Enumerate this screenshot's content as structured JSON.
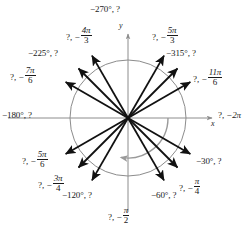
{
  "figure": {
    "title": "",
    "type": "unit-circle-negative-angles",
    "width": 252,
    "height": 227,
    "colors": {
      "ray": "#111111",
      "axis": "#8c8c8c",
      "circle": "#8c8c8c",
      "sweep_arrow": "#9a9a9a",
      "text": "#1a1a1a",
      "background": "#ffffff"
    },
    "origin": {
      "x": 128,
      "y": 118
    },
    "circle_radius": 58,
    "axes": {
      "x_label": "x",
      "y_label": "y",
      "x_extent": [
        8,
        214
      ],
      "y_extent": [
        33,
        214
      ]
    },
    "sweep_arrow": {
      "start_angle_deg": 0,
      "end_angle_deg": -100,
      "radius": 40,
      "direction": "clockwise"
    }
  },
  "chart_data": {
    "type": "scatter",
    "title": "",
    "xlabel": "x",
    "ylabel": "y",
    "rays": [
      {
        "id": "ray-neg-270",
        "angle_deg": 90,
        "label_degrees": "−270°",
        "label_radians": "?",
        "label_text": "−270°, ?",
        "known": "degrees",
        "label_pos": {
          "x": 90,
          "y": 6
        },
        "draw_ray": false
      },
      {
        "id": "ray-neg-5pi-3",
        "angle_deg": 60,
        "label_degrees": "?",
        "label_radians": "−5π/3",
        "num": "−5π",
        "den": "3",
        "label_text": "?, −5π/3",
        "known": "radians",
        "label_pos": {
          "x": 155,
          "y": 28
        },
        "draw_ray": true,
        "length": 72
      },
      {
        "id": "ray-neg-315",
        "angle_deg": 45,
        "label_degrees": "−315°",
        "label_radians": "?",
        "label_text": "−315°, ?",
        "known": "degrees",
        "label_pos": {
          "x": 168,
          "y": 50
        },
        "draw_ray": true,
        "length": 70
      },
      {
        "id": "ray-neg-11pi-6",
        "angle_deg": 30,
        "label_degrees": "?",
        "label_radians": "−11π/6",
        "num": "−11π",
        "den": "6",
        "label_text": "?, −11π/6",
        "known": "radians",
        "label_pos": {
          "x": 198,
          "y": 70
        },
        "draw_ray": true,
        "length": 72
      },
      {
        "id": "ray-neg-2pi",
        "angle_deg": 0,
        "label_degrees": "?",
        "label_radians": "−2π",
        "label_text": "?, −2π",
        "known": "radians",
        "label_pos": {
          "x": 219,
          "y": 110
        },
        "draw_ray": false
      },
      {
        "id": "ray-neg-30",
        "angle_deg": -30,
        "label_degrees": "−30°",
        "label_radians": "?",
        "label_text": "−30°, ?",
        "known": "degrees",
        "label_pos": {
          "x": 197,
          "y": 158
        },
        "draw_ray": true,
        "length": 72
      },
      {
        "id": "ray-neg-pi-4",
        "angle_deg": -45,
        "label_degrees": "?",
        "label_radians": "−π/4",
        "num": "−π",
        "den": "4",
        "label_text": "?, −π/4",
        "known": "radians",
        "label_pos": {
          "x": 180,
          "y": 178
        },
        "draw_ray": true,
        "length": 70
      },
      {
        "id": "ray-neg-60",
        "angle_deg": -60,
        "label_degrees": "−60°",
        "label_radians": "?",
        "label_text": "−60°, ?",
        "known": "degrees",
        "label_pos": {
          "x": 152,
          "y": 192
        },
        "draw_ray": true,
        "length": 72
      },
      {
        "id": "ray-neg-pi-2",
        "angle_deg": -90,
        "label_degrees": "?",
        "label_radians": "−π/2",
        "num": "−π",
        "den": "2",
        "label_text": "?, −π/2",
        "known": "radians",
        "label_pos": {
          "x": 109,
          "y": 208
        },
        "draw_ray": false
      },
      {
        "id": "ray-neg-120",
        "angle_deg": -120,
        "label_degrees": "−120°",
        "label_radians": "?",
        "label_text": "−120°, ?",
        "known": "degrees",
        "label_pos": {
          "x": 63,
          "y": 192
        },
        "draw_ray": true,
        "length": 72
      },
      {
        "id": "ray-neg-3pi-4",
        "angle_deg": -135,
        "label_degrees": "?",
        "label_radians": "−3π/4",
        "num": "−3π",
        "den": "4",
        "label_text": "?, −3π/4",
        "known": "radians",
        "label_pos": {
          "x": 38,
          "y": 176
        },
        "draw_ray": true,
        "length": 70
      },
      {
        "id": "ray-neg-5pi-6",
        "angle_deg": -150,
        "label_degrees": "?",
        "label_radians": "−5π/6",
        "num": "−5π",
        "den": "6",
        "label_text": "?, −5π/6",
        "known": "radians",
        "label_pos": {
          "x": 22,
          "y": 152
        },
        "draw_ray": true,
        "length": 72
      },
      {
        "id": "ray-neg-180",
        "angle_deg": 180,
        "label_degrees": "−180°",
        "label_radians": "?",
        "label_text": "−180°, ?",
        "known": "degrees",
        "label_pos": {
          "x": 2,
          "y": 110
        },
        "draw_ray": false
      },
      {
        "id": "ray-neg-7pi-6",
        "angle_deg": 150,
        "label_degrees": "?",
        "label_radians": "−7π/6",
        "num": "−7π",
        "den": "6",
        "label_text": "?, −7π/6",
        "known": "radians",
        "label_pos": {
          "x": 10,
          "y": 68
        },
        "draw_ray": true,
        "length": 72
      },
      {
        "id": "ray-neg-225",
        "angle_deg": 135,
        "label_degrees": "−225°",
        "label_radians": "?",
        "label_text": "−225°, ?",
        "known": "degrees",
        "label_pos": {
          "x": 28,
          "y": 50
        },
        "draw_ray": true,
        "length": 70
      },
      {
        "id": "ray-neg-4pi-3",
        "angle_deg": 120,
        "label_degrees": "?",
        "label_radians": "−4π/3",
        "num": "−4π",
        "den": "3",
        "label_text": "?, −4π/3",
        "known": "radians",
        "label_pos": {
          "x": 70,
          "y": 28
        },
        "draw_ray": true,
        "length": 72
      }
    ]
  },
  "labels": {
    "neg270": {
      "deg": "−270°",
      "sep": ", ",
      "rad": "?"
    },
    "neg5pi3": {
      "q": "?",
      "sep": ", ",
      "sign": "−",
      "num": "5π",
      "den": "3"
    },
    "neg315": {
      "deg": "−315°",
      "sep": ", ",
      "rad": "?"
    },
    "neg11pi6": {
      "q": "?",
      "sep": ", ",
      "sign": "−",
      "num": "11π",
      "den": "6"
    },
    "neg2pi": {
      "q": "?",
      "sep": ", ",
      "val": "−2π"
    },
    "neg30": {
      "deg": "−30°",
      "sep": ", ",
      "rad": "?"
    },
    "negpi4": {
      "q": "?",
      "sep": ", ",
      "sign": "−",
      "num": "π",
      "den": "4"
    },
    "neg60": {
      "deg": "−60°",
      "sep": ", ",
      "rad": "?"
    },
    "negpi2": {
      "q": "?",
      "sep": ", ",
      "sign": "−",
      "num": "π",
      "den": "2"
    },
    "neg120": {
      "deg": "−120°",
      "sep": ", ",
      "rad": "?"
    },
    "neg3pi4": {
      "q": "?",
      "sep": ", ",
      "sign": "−",
      "num": "3π",
      "den": "4"
    },
    "neg5pi6": {
      "q": "?",
      "sep": ", ",
      "sign": "−",
      "num": "5π",
      "den": "6"
    },
    "neg180": {
      "deg": "−180°",
      "sep": ", ",
      "rad": "?"
    },
    "neg7pi6": {
      "q": "?",
      "sep": ", ",
      "sign": "−",
      "num": "7π",
      "den": "6"
    },
    "neg225": {
      "deg": "−225°",
      "sep": ", ",
      "rad": "?"
    },
    "neg4pi3": {
      "q": "?",
      "sep": ", ",
      "sign": "−",
      "num": "4π",
      "den": "3"
    },
    "axis_x": "x",
    "axis_y": "y"
  }
}
